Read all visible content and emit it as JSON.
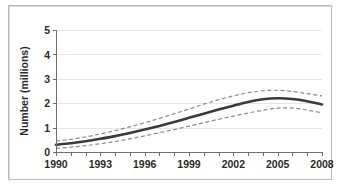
{
  "figure": {
    "background_color": "#ffffff",
    "frame_color": "#b9b9b9"
  },
  "chart_data": {
    "type": "line",
    "title": "",
    "subtitle": "",
    "xlabel": "",
    "ylabel": "Number (millions)",
    "xlim": [
      1990,
      2008
    ],
    "ylim": [
      0,
      5
    ],
    "grid": true,
    "grid_axis": "y",
    "legend": false,
    "legend_position": "none",
    "x": [
      1990,
      1991,
      1992,
      1993,
      1994,
      1995,
      1996,
      1997,
      1998,
      1999,
      2000,
      2001,
      2002,
      2003,
      2004,
      2005,
      2006,
      2007,
      2008
    ],
    "x_tick_labels": [
      "1990",
      "1993",
      "1996",
      "1999",
      "2002",
      "2005",
      "2008"
    ],
    "x_tick_values": [
      1990,
      1993,
      1996,
      1999,
      2002,
      2005,
      2008
    ],
    "x_minor_ticks_every": 1,
    "y_tick_labels": [
      "0",
      "1",
      "2",
      "3",
      "4",
      "5"
    ],
    "y_tick_values": [
      0,
      1,
      2,
      3,
      4,
      5
    ],
    "series": [
      {
        "name": "Upper confidence limit",
        "style": "dashed",
        "color": "#8a8a8a",
        "values": [
          0.45,
          0.52,
          0.62,
          0.74,
          0.88,
          1.03,
          1.2,
          1.38,
          1.57,
          1.76,
          1.96,
          2.14,
          2.3,
          2.43,
          2.51,
          2.53,
          2.48,
          2.39,
          2.3
        ]
      },
      {
        "name": "Estimate",
        "style": "solid",
        "color": "#3a3a3a",
        "values": [
          0.3,
          0.36,
          0.44,
          0.54,
          0.65,
          0.78,
          0.92,
          1.07,
          1.23,
          1.4,
          1.57,
          1.74,
          1.9,
          2.05,
          2.16,
          2.2,
          2.17,
          2.08,
          1.95
        ]
      },
      {
        "name": "Lower confidence limit",
        "style": "dashed",
        "color": "#8a8a8a",
        "values": [
          0.15,
          0.2,
          0.26,
          0.34,
          0.43,
          0.54,
          0.66,
          0.79,
          0.92,
          1.06,
          1.2,
          1.34,
          1.47,
          1.6,
          1.71,
          1.8,
          1.8,
          1.72,
          1.6
        ]
      }
    ]
  }
}
